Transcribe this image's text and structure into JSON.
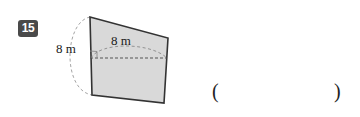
{
  "problem": {
    "number": "15",
    "badge_color": "#4a4a4a",
    "badge_text_color": "#ffffff"
  },
  "figure": {
    "name": "oblique-prism-face",
    "fill_color": "#d9d9d9",
    "stroke_color": "#333333",
    "dashed_color": "#777777",
    "labels": {
      "slant_height": "8 m",
      "top_width": "8 m"
    },
    "vertices": {
      "top_left": [
        90,
        17
      ],
      "top_right": [
        168,
        38
      ],
      "bottom_right": [
        164,
        103
      ],
      "bottom_left": [
        92,
        95
      ]
    },
    "dashed_center_line": {
      "from": [
        90,
        57
      ],
      "to": [
        167,
        57
      ]
    },
    "right_angle_marker": [
      90,
      57
    ]
  },
  "answer": {
    "open_paren": "(",
    "close_paren": ")"
  }
}
